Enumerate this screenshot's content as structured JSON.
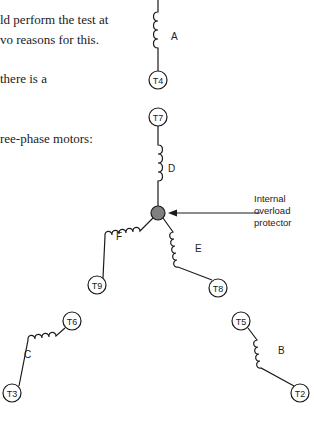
{
  "text_lines": [
    "ld perform the test at",
    "vo reasons for this.",
    "there is a",
    "ree-phase motors:"
  ],
  "diagram": {
    "coils": [
      {
        "label": "A"
      },
      {
        "label": "D"
      },
      {
        "label": "E"
      },
      {
        "label": "F"
      },
      {
        "label": "C"
      },
      {
        "label": "B"
      }
    ],
    "terminals": [
      "T4",
      "T7",
      "T9",
      "T8",
      "T6",
      "T3",
      "T5",
      "T2"
    ],
    "annotation": [
      "Internal",
      "overload",
      "protector"
    ],
    "colors": {
      "line": "#1a1a1a",
      "protector_fill": "#808080"
    }
  }
}
